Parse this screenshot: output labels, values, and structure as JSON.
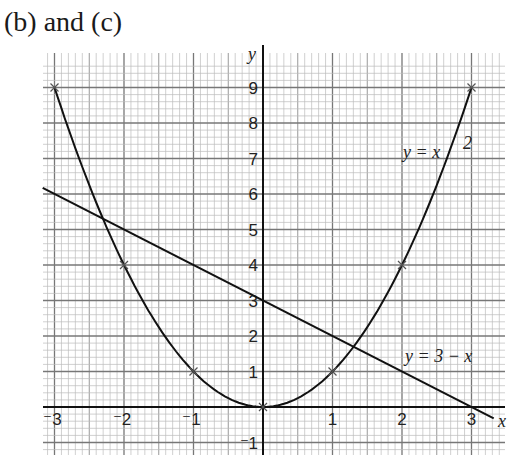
{
  "title": "(b) and (c)",
  "chart_data": {
    "type": "line",
    "title": "(b) and (c)",
    "xlabel": "x",
    "ylabel": "y",
    "xlim": [
      -3.2,
      3.5
    ],
    "ylim": [
      -1.4,
      9.5
    ],
    "grid": true,
    "x_ticks": [
      "-3",
      "-2",
      "-1",
      "1",
      "2",
      "3"
    ],
    "y_ticks": [
      "-1",
      "1",
      "2",
      "3",
      "4",
      "5",
      "6",
      "7",
      "8",
      "9"
    ],
    "series": [
      {
        "name": "y = x²",
        "label": "y = x",
        "label_sup": "2",
        "plotted_points": [
          [
            -3,
            9
          ],
          [
            -2,
            4
          ],
          [
            -1,
            1
          ],
          [
            0,
            0
          ],
          [
            1,
            1
          ],
          [
            2,
            4
          ],
          [
            3,
            9
          ]
        ],
        "marker": "x"
      },
      {
        "name": "y = 3 − x",
        "label": "y = 3 − x",
        "x": [
          -3.17,
          3.32
        ],
        "y": [
          6.17,
          -0.32
        ]
      }
    ],
    "intersections": [
      [
        -2.3,
        5.3
      ],
      [
        1.3,
        1.7
      ]
    ]
  }
}
